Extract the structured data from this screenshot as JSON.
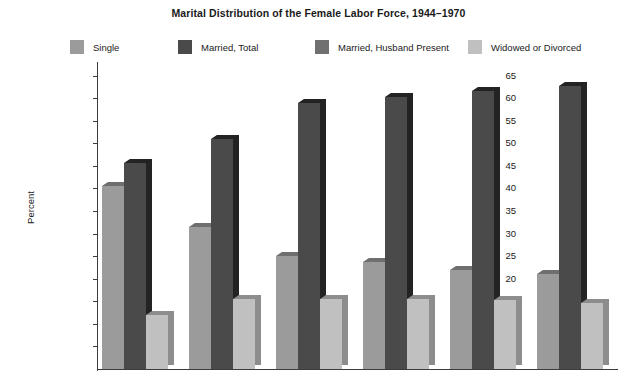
{
  "title": "Marital Distribution of the Female Labor Force, 1944–1970",
  "axis": {
    "ylabel": "Percent",
    "yticks": [
      65,
      60,
      55,
      50,
      45,
      40,
      35,
      30,
      25,
      20,
      15,
      10,
      5
    ],
    "ymin": 0,
    "ymax": 68
  },
  "legend": [
    {
      "label": "Single",
      "color": "#9b9b9b",
      "side": "#6f6f6f"
    },
    {
      "label": "Married, Total",
      "color": "#4a4a4a",
      "side": "#232323"
    },
    {
      "label": "Married, Husband Present",
      "color": "#707070",
      "side": "#4a4a4a"
    },
    {
      "label": "Widowed or Divorced",
      "color": "#c0c0c0",
      "side": "#8d8d8d"
    }
  ],
  "chart_data": {
    "type": "bar",
    "title": "Marital Distribution of the Female Labor Force, 1944–1970",
    "xlabel": "",
    "ylabel": "Percent",
    "ylim": [
      0,
      68
    ],
    "ytick_step": 5,
    "grid": false,
    "legend_position": "top",
    "bar_style": "3d-overlapping",
    "categories": [
      "1944",
      "1950",
      "1955",
      "1960",
      "1965",
      "1970"
    ],
    "series": [
      {
        "name": "Single",
        "values": [
          40.5,
          31.5,
          25.0,
          23.6,
          22.0,
          21.0
        ]
      },
      {
        "name": "Married, Total",
        "values": [
          45.7,
          51.0,
          59.0,
          60.2,
          61.5,
          62.6
        ]
      },
      {
        "name": "Married, Husband Present",
        "values": [
          33.5,
          48.6,
          55.7,
          55.5,
          60.0,
          60.4
        ]
      },
      {
        "name": "Widowed or Divorced",
        "values": [
          11.9,
          15.6,
          15.5,
          15.5,
          15.3,
          14.7
        ]
      }
    ]
  }
}
